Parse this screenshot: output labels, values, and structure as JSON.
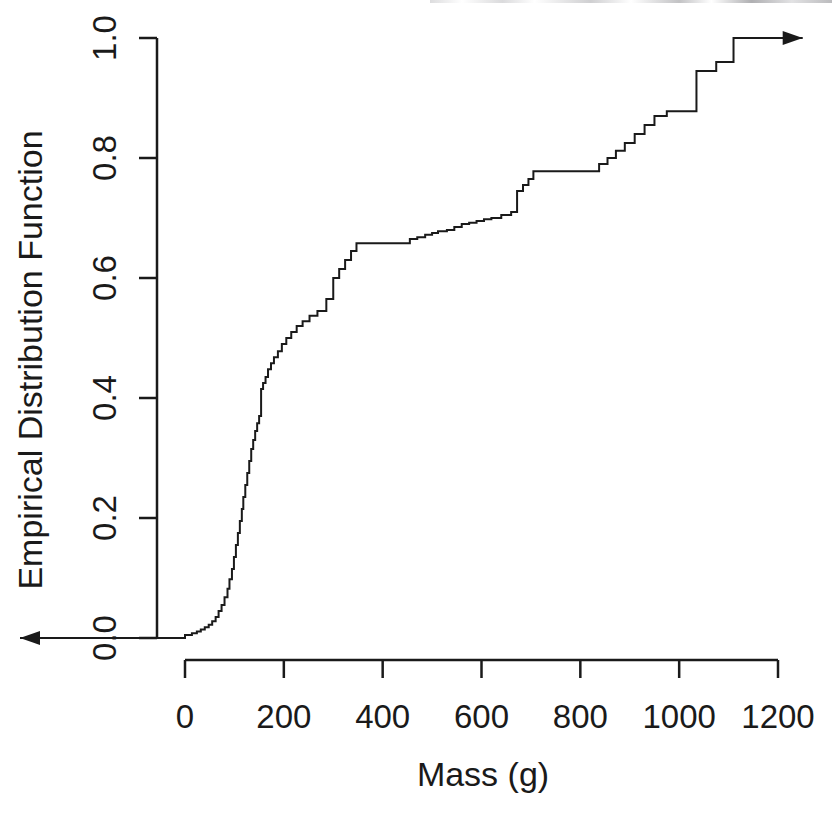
{
  "chart_data": {
    "type": "line",
    "subtype": "ecdf-step",
    "title": "",
    "xlabel": "Mass (g)",
    "ylabel": "Empirical Distribution Function",
    "xlim": [
      -40,
      1240
    ],
    "ylim": [
      0.0,
      1.0
    ],
    "grid": false,
    "legend": null,
    "xticks": [
      0,
      200,
      400,
      600,
      800,
      1000,
      1200
    ],
    "xtick_labels": [
      "0",
      "200",
      "400",
      "600",
      "800",
      "1000",
      "1200"
    ],
    "yticks": [
      0.0,
      0.2,
      0.4,
      0.6,
      0.8,
      1.0
    ],
    "ytick_labels": [
      "0.0",
      "0.2",
      "0.4",
      "0.6",
      "0.8",
      "1.0"
    ],
    "line_color": "#1a1a1a",
    "line_width": 2,
    "left_arrow": {
      "from_x": 185,
      "to_x": 20,
      "at_y": 0.0,
      "note": "step function extends left at 0.0"
    },
    "right_arrow": {
      "from_x": 1110,
      "to_x": 1250,
      "at_y": 1.0,
      "note": "step function extends right at 1.0"
    },
    "x": [
      0,
      14,
      24,
      32,
      40,
      48,
      55,
      62,
      68,
      74,
      80,
      86,
      90,
      95,
      99,
      103,
      107,
      111,
      115,
      118,
      122,
      126,
      130,
      134,
      138,
      142,
      146,
      150,
      154,
      158,
      163,
      168,
      174,
      180,
      188,
      196,
      205,
      215,
      226,
      238,
      252,
      268,
      286,
      300,
      312,
      324,
      336,
      347,
      442,
      455,
      470,
      486,
      500,
      512,
      530,
      545,
      560,
      575,
      590,
      605,
      620,
      640,
      660,
      672,
      684,
      695,
      705,
      822,
      838,
      855,
      872,
      890,
      910,
      930,
      950,
      975,
      1000,
      1035,
      1075,
      1110
    ],
    "y": [
      0.005,
      0.008,
      0.011,
      0.014,
      0.018,
      0.022,
      0.028,
      0.035,
      0.045,
      0.055,
      0.068,
      0.082,
      0.098,
      0.115,
      0.135,
      0.155,
      0.175,
      0.195,
      0.215,
      0.235,
      0.255,
      0.275,
      0.295,
      0.315,
      0.33,
      0.345,
      0.358,
      0.37,
      0.415,
      0.425,
      0.435,
      0.448,
      0.458,
      0.468,
      0.478,
      0.49,
      0.5,
      0.51,
      0.52,
      0.528,
      0.537,
      0.545,
      0.565,
      0.6,
      0.615,
      0.63,
      0.645,
      0.658,
      0.658,
      0.665,
      0.668,
      0.672,
      0.675,
      0.678,
      0.68,
      0.685,
      0.69,
      0.692,
      0.695,
      0.698,
      0.7,
      0.705,
      0.71,
      0.745,
      0.755,
      0.765,
      0.778,
      0.778,
      0.79,
      0.8,
      0.812,
      0.825,
      0.84,
      0.855,
      0.87,
      0.878,
      0.878,
      0.945,
      0.96,
      1.0
    ]
  },
  "axes": {
    "x_title": "Mass (g)",
    "y_title": "Empirical Distribution Function"
  }
}
